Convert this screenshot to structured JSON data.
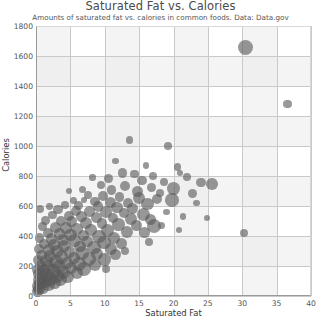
{
  "chart_data": {
    "type": "scatter",
    "title": "Saturated Fat vs. Calories",
    "subtitle": "Amounts of saturated fat vs. calories in common foods. Data: Data.gov",
    "xlabel": "Saturated Fat",
    "ylabel": "Calories",
    "xlim": [
      0,
      40
    ],
    "ylim": [
      0,
      1800
    ],
    "xticks": [
      0,
      5,
      10,
      15,
      20,
      25,
      30,
      35,
      40
    ],
    "yticks": [
      0,
      200,
      400,
      600,
      800,
      1000,
      1200,
      1400,
      1600,
      1800
    ],
    "grid": true,
    "legend": "none",
    "marker_color": "#595959",
    "marker_opacity": 0.62,
    "background_band_color": "#ebebeb",
    "gridline_color": "#c9c9c9",
    "points": [
      {
        "x": 30.5,
        "y": 1660,
        "r": 7.5
      },
      {
        "x": 36.6,
        "y": 1280,
        "r": 4.2
      },
      {
        "x": 30.2,
        "y": 420,
        "r": 4.0
      },
      {
        "x": 13.6,
        "y": 1040,
        "r": 3.6
      },
      {
        "x": 19.2,
        "y": 1000,
        "r": 3.8
      },
      {
        "x": 11.6,
        "y": 900,
        "r": 3.4
      },
      {
        "x": 16.0,
        "y": 870,
        "r": 3.4
      },
      {
        "x": 20.6,
        "y": 860,
        "r": 3.6
      },
      {
        "x": 12.6,
        "y": 820,
        "r": 4.6
      },
      {
        "x": 14.3,
        "y": 812,
        "r": 4.2
      },
      {
        "x": 17.0,
        "y": 800,
        "r": 4.0
      },
      {
        "x": 22.0,
        "y": 795,
        "r": 3.8
      },
      {
        "x": 8.2,
        "y": 790,
        "r": 3.2
      },
      {
        "x": 10.6,
        "y": 785,
        "r": 4.4
      },
      {
        "x": 15.4,
        "y": 770,
        "r": 4.8
      },
      {
        "x": 18.6,
        "y": 760,
        "r": 4.2
      },
      {
        "x": 24.0,
        "y": 755,
        "r": 4.6
      },
      {
        "x": 25.6,
        "y": 745,
        "r": 5.8
      },
      {
        "x": 9.4,
        "y": 740,
        "r": 4.0
      },
      {
        "x": 13.0,
        "y": 735,
        "r": 5.0
      },
      {
        "x": 16.8,
        "y": 725,
        "r": 4.4
      },
      {
        "x": 20.0,
        "y": 715,
        "r": 6.4
      },
      {
        "x": 6.8,
        "y": 710,
        "r": 3.6
      },
      {
        "x": 11.0,
        "y": 705,
        "r": 4.8
      },
      {
        "x": 14.8,
        "y": 695,
        "r": 5.4
      },
      {
        "x": 18.0,
        "y": 690,
        "r": 4.0
      },
      {
        "x": 22.8,
        "y": 685,
        "r": 4.4
      },
      {
        "x": 7.6,
        "y": 675,
        "r": 4.2
      },
      {
        "x": 9.8,
        "y": 668,
        "r": 5.0
      },
      {
        "x": 12.2,
        "y": 660,
        "r": 4.6
      },
      {
        "x": 15.0,
        "y": 655,
        "r": 6.0
      },
      {
        "x": 17.6,
        "y": 648,
        "r": 5.2
      },
      {
        "x": 19.8,
        "y": 640,
        "r": 6.8
      },
      {
        "x": 5.4,
        "y": 636,
        "r": 3.4
      },
      {
        "x": 8.6,
        "y": 630,
        "r": 4.8
      },
      {
        "x": 10.8,
        "y": 625,
        "r": 5.6
      },
      {
        "x": 13.4,
        "y": 620,
        "r": 5.0
      },
      {
        "x": 16.2,
        "y": 612,
        "r": 6.2
      },
      {
        "x": 4.2,
        "y": 608,
        "r": 3.8
      },
      {
        "x": 6.2,
        "y": 602,
        "r": 4.4
      },
      {
        "x": 9.0,
        "y": 596,
        "r": 5.2
      },
      {
        "x": 11.8,
        "y": 590,
        "r": 5.8
      },
      {
        "x": 14.0,
        "y": 584,
        "r": 5.4
      },
      {
        "x": 0.6,
        "y": 580,
        "r": 4.0
      },
      {
        "x": 3.2,
        "y": 575,
        "r": 4.6
      },
      {
        "x": 5.8,
        "y": 570,
        "r": 5.0
      },
      {
        "x": 7.8,
        "y": 564,
        "r": 5.6
      },
      {
        "x": 10.2,
        "y": 558,
        "r": 6.0
      },
      {
        "x": 12.8,
        "y": 552,
        "r": 5.2
      },
      {
        "x": 15.6,
        "y": 546,
        "r": 6.6
      },
      {
        "x": 2.4,
        "y": 540,
        "r": 4.2
      },
      {
        "x": 4.8,
        "y": 536,
        "r": 5.0
      },
      {
        "x": 6.6,
        "y": 530,
        "r": 5.4
      },
      {
        "x": 8.8,
        "y": 524,
        "r": 5.8
      },
      {
        "x": 11.2,
        "y": 518,
        "r": 5.0
      },
      {
        "x": 13.8,
        "y": 512,
        "r": 6.2
      },
      {
        "x": 16.6,
        "y": 508,
        "r": 5.4
      },
      {
        "x": 1.4,
        "y": 504,
        "r": 4.4
      },
      {
        "x": 3.6,
        "y": 500,
        "r": 5.2
      },
      {
        "x": 5.2,
        "y": 494,
        "r": 5.6
      },
      {
        "x": 7.2,
        "y": 488,
        "r": 6.0
      },
      {
        "x": 9.6,
        "y": 482,
        "r": 5.4
      },
      {
        "x": 12.0,
        "y": 476,
        "r": 6.4
      },
      {
        "x": 14.6,
        "y": 470,
        "r": 5.8
      },
      {
        "x": 17.2,
        "y": 466,
        "r": 7.0
      },
      {
        "x": 0.9,
        "y": 462,
        "r": 4.6
      },
      {
        "x": 2.8,
        "y": 458,
        "r": 5.4
      },
      {
        "x": 4.4,
        "y": 452,
        "r": 5.8
      },
      {
        "x": 6.0,
        "y": 446,
        "r": 6.2
      },
      {
        "x": 8.0,
        "y": 440,
        "r": 5.6
      },
      {
        "x": 10.4,
        "y": 434,
        "r": 6.6
      },
      {
        "x": 13.2,
        "y": 428,
        "r": 6.0
      },
      {
        "x": 15.8,
        "y": 424,
        "r": 5.2
      },
      {
        "x": 1.8,
        "y": 420,
        "r": 5.0
      },
      {
        "x": 3.4,
        "y": 414,
        "r": 5.8
      },
      {
        "x": 5.0,
        "y": 408,
        "r": 6.2
      },
      {
        "x": 6.9,
        "y": 402,
        "r": 5.6
      },
      {
        "x": 9.2,
        "y": 396,
        "r": 6.8
      },
      {
        "x": 11.4,
        "y": 390,
        "r": 6.0
      },
      {
        "x": 0.5,
        "y": 386,
        "r": 4.8
      },
      {
        "x": 2.2,
        "y": 380,
        "r": 5.6
      },
      {
        "x": 3.9,
        "y": 374,
        "r": 6.0
      },
      {
        "x": 5.6,
        "y": 368,
        "r": 6.4
      },
      {
        "x": 7.4,
        "y": 362,
        "r": 5.8
      },
      {
        "x": 9.9,
        "y": 356,
        "r": 6.6
      },
      {
        "x": 12.4,
        "y": 350,
        "r": 5.4
      },
      {
        "x": 1.2,
        "y": 346,
        "r": 5.2
      },
      {
        "x": 2.6,
        "y": 340,
        "r": 5.8
      },
      {
        "x": 4.1,
        "y": 334,
        "r": 6.2
      },
      {
        "x": 6.4,
        "y": 328,
        "r": 5.6
      },
      {
        "x": 8.4,
        "y": 322,
        "r": 6.8
      },
      {
        "x": 10.9,
        "y": 316,
        "r": 6.0
      },
      {
        "x": 0.4,
        "y": 312,
        "r": 5.0
      },
      {
        "x": 1.9,
        "y": 306,
        "r": 5.8
      },
      {
        "x": 3.1,
        "y": 300,
        "r": 6.4
      },
      {
        "x": 4.9,
        "y": 294,
        "r": 5.8
      },
      {
        "x": 6.7,
        "y": 288,
        "r": 7.0
      },
      {
        "x": 8.9,
        "y": 282,
        "r": 6.2
      },
      {
        "x": 11.6,
        "y": 276,
        "r": 5.4
      },
      {
        "x": 0.8,
        "y": 272,
        "r": 5.4
      },
      {
        "x": 2.1,
        "y": 266,
        "r": 6.0
      },
      {
        "x": 3.7,
        "y": 260,
        "r": 6.6
      },
      {
        "x": 5.5,
        "y": 254,
        "r": 6.0
      },
      {
        "x": 7.7,
        "y": 248,
        "r": 7.2
      },
      {
        "x": 10.0,
        "y": 242,
        "r": 6.4
      },
      {
        "x": 0.3,
        "y": 238,
        "r": 5.2
      },
      {
        "x": 1.5,
        "y": 232,
        "r": 6.2
      },
      {
        "x": 2.9,
        "y": 226,
        "r": 6.8
      },
      {
        "x": 4.5,
        "y": 220,
        "r": 6.2
      },
      {
        "x": 6.3,
        "y": 214,
        "r": 7.0
      },
      {
        "x": 8.6,
        "y": 208,
        "r": 6.0
      },
      {
        "x": 0.7,
        "y": 204,
        "r": 5.6
      },
      {
        "x": 1.7,
        "y": 198,
        "r": 6.4
      },
      {
        "x": 3.3,
        "y": 192,
        "r": 7.0
      },
      {
        "x": 5.1,
        "y": 186,
        "r": 6.4
      },
      {
        "x": 7.0,
        "y": 180,
        "r": 6.8
      },
      {
        "x": 0.2,
        "y": 176,
        "r": 5.4
      },
      {
        "x": 1.1,
        "y": 170,
        "r": 6.6
      },
      {
        "x": 2.5,
        "y": 164,
        "r": 7.2
      },
      {
        "x": 4.0,
        "y": 158,
        "r": 6.6
      },
      {
        "x": 5.9,
        "y": 152,
        "r": 6.0
      },
      {
        "x": 0.5,
        "y": 146,
        "r": 6.0
      },
      {
        "x": 1.6,
        "y": 140,
        "r": 6.8
      },
      {
        "x": 3.0,
        "y": 134,
        "r": 7.0
      },
      {
        "x": 4.6,
        "y": 128,
        "r": 6.2
      },
      {
        "x": 0.9,
        "y": 122,
        "r": 6.4
      },
      {
        "x": 2.0,
        "y": 116,
        "r": 7.0
      },
      {
        "x": 3.5,
        "y": 110,
        "r": 6.6
      },
      {
        "x": 0.4,
        "y": 104,
        "r": 6.0
      },
      {
        "x": 1.3,
        "y": 98,
        "r": 6.8
      },
      {
        "x": 2.7,
        "y": 92,
        "r": 6.4
      },
      {
        "x": 0.7,
        "y": 84,
        "r": 6.6
      },
      {
        "x": 1.8,
        "y": 76,
        "r": 6.2
      },
      {
        "x": 0.3,
        "y": 68,
        "r": 6.0
      },
      {
        "x": 1.0,
        "y": 58,
        "r": 6.4
      },
      {
        "x": 0.5,
        "y": 46,
        "r": 6.0
      },
      {
        "x": 0.2,
        "y": 32,
        "r": 5.6
      },
      {
        "x": 4.8,
        "y": 700,
        "r": 3.0
      },
      {
        "x": 7.0,
        "y": 640,
        "r": 3.2
      },
      {
        "x": 2.0,
        "y": 596,
        "r": 3.4
      },
      {
        "x": 19.0,
        "y": 560,
        "r": 3.4
      },
      {
        "x": 21.4,
        "y": 530,
        "r": 3.2
      },
      {
        "x": 18.2,
        "y": 470,
        "r": 3.6
      },
      {
        "x": 20.8,
        "y": 440,
        "r": 3.2
      },
      {
        "x": 16.4,
        "y": 360,
        "r": 3.8
      },
      {
        "x": 13.0,
        "y": 300,
        "r": 4.0
      },
      {
        "x": 10.2,
        "y": 180,
        "r": 4.2
      },
      {
        "x": 21.0,
        "y": 820,
        "r": 3.0
      },
      {
        "x": 23.4,
        "y": 620,
        "r": 3.4
      },
      {
        "x": 24.8,
        "y": 520,
        "r": 3.0
      }
    ]
  }
}
